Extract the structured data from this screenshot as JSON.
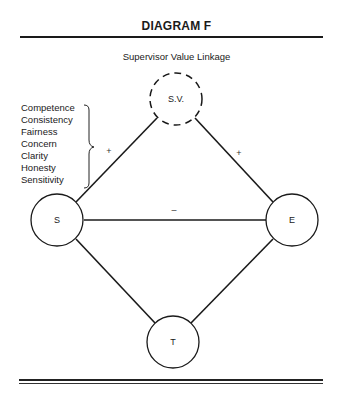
{
  "header": {
    "title": "DIAGRAM F",
    "subtitle": "Supervisor Value Linkage"
  },
  "values_list": {
    "items": [
      "Competence",
      "Consistency",
      "Fairness",
      "Concern",
      "Clarity",
      "Honesty",
      "Sensitivity"
    ]
  },
  "nodes": {
    "sv": {
      "label": "S.V.",
      "style": "dashed"
    },
    "s": {
      "label": "S",
      "style": "solid"
    },
    "e": {
      "label": "E",
      "style": "solid"
    },
    "t": {
      "label": "T",
      "style": "solid"
    }
  },
  "edges": {
    "s_sv": {
      "from": "S",
      "to": "S.V.",
      "sign": "+"
    },
    "sv_e": {
      "from": "S.V.",
      "to": "E",
      "sign": "+"
    },
    "s_e": {
      "from": "S",
      "to": "E",
      "sign": "–"
    },
    "s_t": {
      "from": "S",
      "to": "T",
      "sign": ""
    },
    "e_t": {
      "from": "E",
      "to": "T",
      "sign": ""
    }
  }
}
